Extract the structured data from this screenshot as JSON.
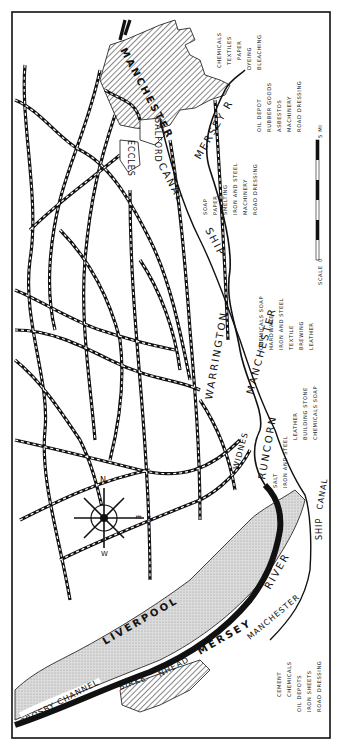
{
  "map": {
    "title": "Manchester Ship Canal and Mersey Industrial Region",
    "orientation": "rotated 90 degrees clockwise",
    "colors": {
      "ink": "#111111",
      "paper": "#ffffff",
      "sand": "#d6d6d6",
      "hatch": "#222222"
    },
    "towns": {
      "manchester": "MANCHESTER",
      "salford": "SALFORD",
      "eccles": "ECCLES",
      "warrington": "WARRINGTON",
      "widnes": "WIDNES",
      "runcorn": "RUNCORN",
      "liverpool": "LIVERPOOL",
      "birkenhead_a": "BIRKE",
      "birkenhead_b": "NHEAD"
    },
    "waterways": {
      "mersey_r": "MERSEY  R",
      "ship": "SHIP",
      "canal": "CANAL",
      "manchester_canal": "MANCHESTER",
      "river": "RIVER",
      "mersey": "MERSEY",
      "manchester_lower": "MANCHESTER",
      "ship_lower": "SHIP",
      "canal_lower": "CANAL",
      "crosby_channel": "CROSBY CHANNEL"
    },
    "compass": {
      "n": "N",
      "e": "E",
      "s": "S",
      "w": "W"
    },
    "scale": {
      "label": "SCALE",
      "start": "0",
      "end": "5 MI"
    },
    "industries": {
      "manchester_top": [
        "CHEMICALS",
        "TEXTILES",
        "PAPER",
        "DYEING",
        "BLEACHING"
      ],
      "manchester_mid": [
        "OIL DEPOT",
        "RUBBER GOODS",
        "ASBESTOS",
        "MACHINERY",
        "ROAD DRESSING"
      ],
      "irlam": [
        "SOAP",
        "PAPER",
        "SMELTING",
        "IRON AND STEEL",
        "MACHINERY",
        "ROAD DRESSING"
      ],
      "warrington": [
        "CHEMICALS  SOAP",
        "HARDWARE",
        "IRON AND STEEL",
        "TEXTILE",
        "BREWING",
        "LEATHER"
      ],
      "runcorn": [
        "SALT",
        "IRON AND STEEL",
        "LEATHER",
        "BUILDING STONE",
        "CHEMICALS  SOAP"
      ],
      "birkenhead": [
        "CEMENT",
        "CHEMICALS",
        "OIL DEPOTS",
        "IRON SHEETS",
        "ROAD DRESSING"
      ]
    }
  }
}
